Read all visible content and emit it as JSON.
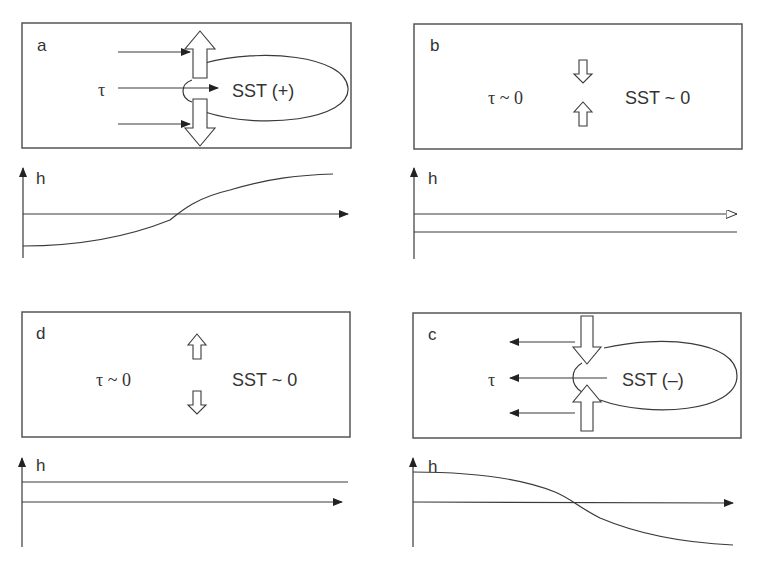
{
  "panels": {
    "a": {
      "label": "a",
      "tau": "τ",
      "sst": "SST (+)",
      "h_label": "h",
      "h_profile": "rising: negative on left, crosses zero at center, positive on right"
    },
    "b": {
      "label": "b",
      "tau": "τ ~ 0",
      "sst": "SST ~ 0",
      "h_label": "h",
      "h_profile": "flat: below axis"
    },
    "c": {
      "label": "c",
      "tau": "τ",
      "sst": "SST (–)",
      "h_label": "h",
      "h_profile": "falling: positive on left, crosses zero at center, negative on right"
    },
    "d": {
      "label": "d",
      "tau": "τ ~ 0",
      "sst": "SST ~ 0",
      "h_label": "h",
      "h_profile": "flat: above axis"
    }
  },
  "colors": {
    "line": "#3a3a3a",
    "box": "#555555",
    "background": "#ffffff"
  }
}
